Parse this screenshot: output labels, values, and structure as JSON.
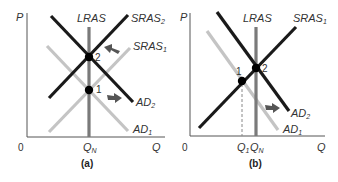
{
  "colors": {
    "dark_line": "#1a1a1a",
    "light_line": "#c4c4c4",
    "lras_line": "#7a7a7a",
    "axis": "#555555",
    "arrow": "#555555",
    "text": "#333333"
  },
  "panel_a": {
    "caption": "(a)",
    "axis_y_label": "P",
    "axis_x_label": "Q",
    "origin_label": "0",
    "x_tick": "Q",
    "x_tick_sub": "N",
    "lras_label": "LRAS",
    "sras2_label": "SRAS",
    "sras2_sub": "2",
    "sras1_label": "SRAS",
    "sras1_sub": "1",
    "ad2_label": "AD",
    "ad2_sub": "2",
    "ad1_label": "AD",
    "ad1_sub": "1",
    "point1_label": "1",
    "point2_label": "2"
  },
  "panel_b": {
    "caption": "(b)",
    "axis_y_label": "P",
    "axis_x_label": "Q",
    "origin_label": "0",
    "x_tick1": "Q",
    "x_tick1_sub": "1",
    "x_tick2": "Q",
    "x_tick2_sub": "N",
    "lras_label": "LRAS",
    "sras1_label": "SRAS",
    "sras1_sub": "1",
    "ad2_label": "AD",
    "ad2_sub": "2",
    "ad1_label": "AD",
    "ad1_sub": "1",
    "point1_label": "1",
    "point2_label": "2"
  }
}
